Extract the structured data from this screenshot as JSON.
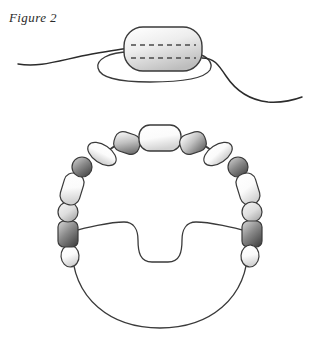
{
  "figure": {
    "caption": "Figure 2",
    "background_color": "#ffffff",
    "stroke_color": "#2b2b2b",
    "panels": [
      {
        "id": "nucleosome-panel",
        "name": "nucleosome-with-dna",
        "description": "single rounded core particle with two dashed internal lines and a DNA strand passing around it",
        "core": {
          "shape": "rounded-rectangle",
          "x": 124,
          "y": 27,
          "width": 78,
          "height": 44,
          "rx": 18,
          "fill_light": "#ffffff",
          "fill_shade": "#c9c9c9",
          "stroke": "#333333"
        },
        "dashed_lines": [
          {
            "y": 45,
            "x1": 131,
            "x2": 196
          },
          {
            "y": 58,
            "x1": 131,
            "x2": 196
          }
        ],
        "dna_strand": {
          "left_tail_label": "dna-left-tail",
          "right_tail_label": "dna-right-tail",
          "wrap_label": "dna-wrap-loop"
        }
      },
      {
        "id": "chromatin-ring-panel",
        "name": "beaded-chromatin-loop",
        "description": "horseshoe of alternating light and dark beads over a large notched loop of DNA",
        "loop": {
          "name": "dna-notched-loop",
          "notch": "u-shaped-keyhole",
          "center_x": 160,
          "center_y": 235,
          "radius": 92
        },
        "beads": [
          {
            "i": 0,
            "name": "bead-top-center",
            "shape": "rounded-rect",
            "tone": "white",
            "cx": 160,
            "cy": 138,
            "rx": 21,
            "ry": 13,
            "rot": 0
          },
          {
            "i": 1,
            "name": "bead-upper-right-1",
            "shape": "rounded-rect",
            "tone": "mid-gray",
            "cx": 193,
            "cy": 143,
            "rx": 13,
            "ry": 10,
            "rot": -18
          },
          {
            "i": 2,
            "name": "bead-upper-right-2",
            "shape": "ellipse",
            "tone": "white",
            "cx": 218,
            "cy": 154,
            "rx": 16,
            "ry": 9,
            "rot": -34
          },
          {
            "i": 3,
            "name": "bead-right-1",
            "shape": "circle",
            "tone": "dark-gray",
            "cx": 238,
            "cy": 167,
            "rx": 10,
            "ry": 10,
            "rot": 0
          },
          {
            "i": 4,
            "name": "bead-right-2",
            "shape": "rounded-rect",
            "tone": "white",
            "cx": 248,
            "cy": 189,
            "rx": 10,
            "ry": 16,
            "rot": -17
          },
          {
            "i": 5,
            "name": "bead-right-3",
            "shape": "circle",
            "tone": "light-gray",
            "cx": 252,
            "cy": 212,
            "rx": 10,
            "ry": 10,
            "rot": 0
          },
          {
            "i": 6,
            "name": "bead-right-4",
            "shape": "rounded-rect",
            "tone": "dark-gray",
            "cx": 252,
            "cy": 234,
            "rx": 10,
            "ry": 13,
            "rot": 0
          },
          {
            "i": 7,
            "name": "bead-right-5",
            "shape": "ellipse",
            "tone": "white",
            "cx": 250,
            "cy": 256,
            "rx": 9,
            "ry": 11,
            "rot": 5
          },
          {
            "i": 8,
            "name": "bead-upper-left-1",
            "shape": "rounded-rect",
            "tone": "mid-gray",
            "cx": 127,
            "cy": 143,
            "rx": 13,
            "ry": 10,
            "rot": 18
          },
          {
            "i": 9,
            "name": "bead-upper-left-2",
            "shape": "ellipse",
            "tone": "white",
            "cx": 102,
            "cy": 154,
            "rx": 16,
            "ry": 9,
            "rot": 34
          },
          {
            "i": 10,
            "name": "bead-left-1",
            "shape": "circle",
            "tone": "dark-gray",
            "cx": 82,
            "cy": 167,
            "rx": 10,
            "ry": 10,
            "rot": 0
          },
          {
            "i": 11,
            "name": "bead-left-2",
            "shape": "rounded-rect",
            "tone": "white",
            "cx": 72,
            "cy": 189,
            "rx": 10,
            "ry": 16,
            "rot": 17
          },
          {
            "i": 12,
            "name": "bead-left-3",
            "shape": "circle",
            "tone": "light-gray",
            "cx": 68,
            "cy": 212,
            "rx": 10,
            "ry": 10,
            "rot": 0
          },
          {
            "i": 13,
            "name": "bead-left-4",
            "shape": "rounded-rect",
            "tone": "dark-gray",
            "cx": 68,
            "cy": 234,
            "rx": 10,
            "ry": 13,
            "rot": 0
          },
          {
            "i": 14,
            "name": "bead-left-5",
            "shape": "ellipse",
            "tone": "white",
            "cx": 70,
            "cy": 256,
            "rx": 9,
            "ry": 11,
            "rot": -5
          }
        ],
        "linkers": [
          {
            "name": "linker-top-left",
            "from": 0,
            "to": 8
          },
          {
            "name": "linker-top-right",
            "from": 0,
            "to": 1
          }
        ]
      }
    ],
    "tones": {
      "white": {
        "light": "#ffffff",
        "dark": "#dcdcdc"
      },
      "light-gray": {
        "light": "#e8e8e8",
        "dark": "#a8a8a8"
      },
      "mid-gray": {
        "light": "#f2f2f2",
        "dark": "#6e6e6e"
      },
      "dark-gray": {
        "light": "#9a9a9a",
        "dark": "#4a4a4a"
      }
    }
  }
}
